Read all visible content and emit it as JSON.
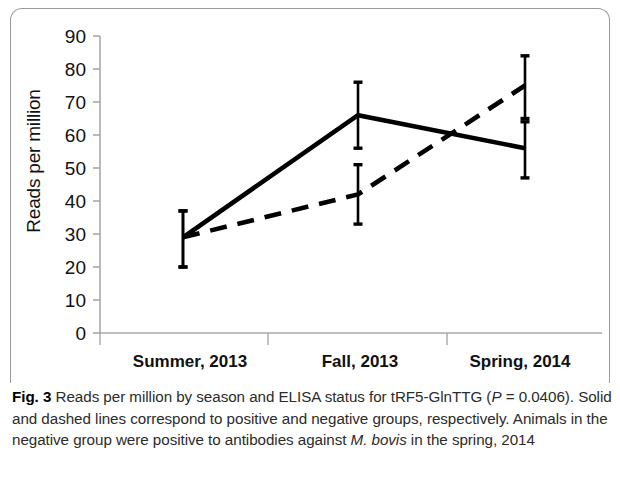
{
  "figure": {
    "label": "Fig. 3",
    "caption_part1": " Reads per million by season and ELISA status for tRF5-GlnTTG (",
    "caption_p_italic": "P",
    "caption_part2": " = 0.0406). Solid and dashed lines correspond to positive and negative groups, respectively. Animals in the negative group were positive to antibodies against ",
    "caption_species_italic": "M. bovis",
    "caption_part3": " in the spring, 2014"
  },
  "chart_data": {
    "type": "line",
    "title": "",
    "xlabel": "",
    "ylabel": "Reads per million",
    "categories": [
      "Summer, 2013",
      "Fall, 2013",
      "Spring, 2014"
    ],
    "ylim": [
      0,
      90
    ],
    "yticks": [
      0,
      10,
      20,
      30,
      40,
      50,
      60,
      70,
      80,
      90
    ],
    "ytick_labels": [
      "0",
      "10",
      "20",
      "30",
      "40",
      "50",
      "60",
      "70",
      "80",
      "90"
    ],
    "grid": false,
    "legend": "none",
    "series": [
      {
        "name": "positive",
        "style": "solid",
        "color": "#000000",
        "values": [
          29,
          66,
          56
        ],
        "error_upper": [
          37,
          76,
          64
        ],
        "error_lower": [
          20,
          56,
          47
        ]
      },
      {
        "name": "negative",
        "style": "dashed",
        "color": "#000000",
        "values": [
          29,
          42,
          75
        ],
        "error_upper": [
          37,
          51,
          84
        ],
        "error_lower": [
          20,
          33,
          65
        ]
      }
    ]
  }
}
